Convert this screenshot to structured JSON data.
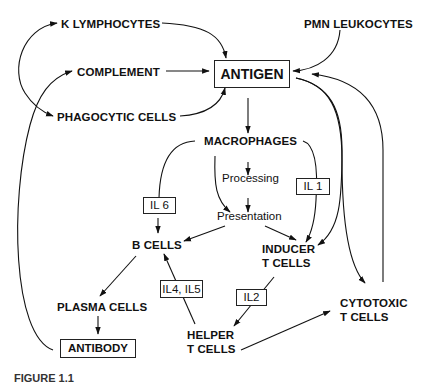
{
  "diagram": {
    "nodes": {
      "k_lymphocytes": "K LYMPHOCYTES",
      "pmn_leukocytes": "PMN LEUKOCYTES",
      "complement": "COMPLEMENT",
      "antigen": "ANTIGEN",
      "phagocytic_cells": "PHAGOCYTIC CELLS",
      "macrophages": "MACROPHAGES",
      "processing": "Processing",
      "presentation": "Presentation",
      "b_cells": "B CELLS",
      "inducer_t_cells_line1": "INDUCER",
      "inducer_t_cells_line2": "T CELLS",
      "plasma_cells": "PLASMA CELLS",
      "antibody": "ANTIBODY",
      "helper_t_cells_line1": "HELPER",
      "helper_t_cells_line2": "T CELLS",
      "cytotoxic_t_cells_line1": "CYTOTOXIC",
      "cytotoxic_t_cells_line2": "T CELLS"
    },
    "cytokines": {
      "il6": "IL 6",
      "il1": "IL 1",
      "il4_il5": "IL4, IL5",
      "il2": "IL2"
    },
    "edges": [
      {
        "from": "K LYMPHOCYTES",
        "to": "ANTIGEN"
      },
      {
        "from": "PMN LEUKOCYTES",
        "to": "ANTIGEN"
      },
      {
        "from": "COMPLEMENT",
        "to": "ANTIGEN"
      },
      {
        "from": "PHAGOCYTIC CELLS",
        "to": "ANTIGEN"
      },
      {
        "from": "K LYMPHOCYTES",
        "to": "PHAGOCYTIC CELLS"
      },
      {
        "from": "PHAGOCYTIC CELLS",
        "to": "K LYMPHOCYTES"
      },
      {
        "from": "ANTIBODY",
        "to": "COMPLEMENT"
      },
      {
        "from": "ANTIGEN",
        "to": "MACROPHAGES"
      },
      {
        "from": "MACROPHAGES",
        "to": "Processing"
      },
      {
        "from": "Processing",
        "to": "Presentation"
      },
      {
        "from": "MACROPHAGES",
        "to": "Presentation"
      },
      {
        "from": "MACROPHAGES",
        "to": "B CELLS",
        "via": "IL 6"
      },
      {
        "from": "MACROPHAGES",
        "to": "INDUCER T CELLS",
        "via": "IL 1"
      },
      {
        "from": "Presentation",
        "to": "B CELLS"
      },
      {
        "from": "Presentation",
        "to": "INDUCER T CELLS"
      },
      {
        "from": "ANTIGEN",
        "to": "INDUCER T CELLS"
      },
      {
        "from": "ANTIGEN",
        "to": "CYTOTOXIC T CELLS"
      },
      {
        "from": "CYTOTOXIC T CELLS",
        "to": "ANTIGEN"
      },
      {
        "from": "B CELLS",
        "to": "PLASMA CELLS"
      },
      {
        "from": "PLASMA CELLS",
        "to": "ANTIBODY"
      },
      {
        "from": "HELPER T CELLS",
        "to": "B CELLS",
        "via": "IL4, IL5"
      },
      {
        "from": "INDUCER T CELLS",
        "to": "HELPER T CELLS",
        "via": "IL2"
      },
      {
        "from": "HELPER T CELLS",
        "to": "CYTOTOXIC T CELLS"
      }
    ]
  },
  "caption": "FIGURE 1.1"
}
